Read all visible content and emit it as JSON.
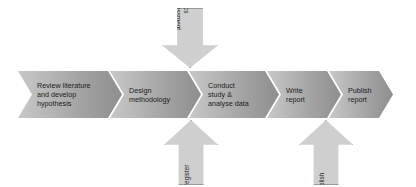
{
  "diagram": {
    "type": "process-flow",
    "colors": {
      "chevron_light": "#c8c8c8",
      "chevron_dark": "#8e8e8e",
      "arrow_fill": "#cfcfcf",
      "arrow_border": "#9a9a9a",
      "text": "#1c1c1c",
      "background": "#ffffff"
    },
    "steps": [
      {
        "id": "review-literature",
        "label": "Review literature\nand develop\nhypothesis",
        "order": 1
      },
      {
        "id": "design-methodology",
        "label": "Design\nmethodology",
        "order": 2
      },
      {
        "id": "conduct-study",
        "label": "Conduct\nstudy &\nanalyse data",
        "order": 3
      },
      {
        "id": "write-report",
        "label": "Write\nreport",
        "order": 4
      },
      {
        "id": "publish-report",
        "label": "Publish\nreport",
        "order": 5
      }
    ],
    "annotations": [
      {
        "id": "ethics-assessment",
        "label": "Ethics\nassessment",
        "direction": "down",
        "points_to": "conduct-study"
      },
      {
        "id": "review-and-preregister",
        "label": "Review and\npreregister",
        "direction": "up",
        "points_to": "conduct-study"
      },
      {
        "id": "review-to-publish",
        "label": "Review to\npublish",
        "direction": "up",
        "points_to": "publish-report"
      }
    ]
  }
}
